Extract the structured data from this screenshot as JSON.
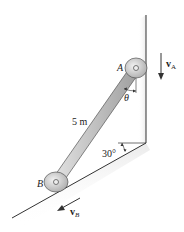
{
  "diagram": {
    "labels": {
      "point_a": "A",
      "point_b": "B",
      "length": "5 m",
      "angle_slope": "30°",
      "angle_theta": "θ",
      "velocity_a": "v",
      "velocity_a_sub": "A",
      "velocity_b": "v",
      "velocity_b_sub": "B"
    },
    "colors": {
      "line": "#333333",
      "rod_fill": "#c8c8c8",
      "collar_fill": "#d9d9d9",
      "shadow": "#e6e6e6"
    }
  }
}
